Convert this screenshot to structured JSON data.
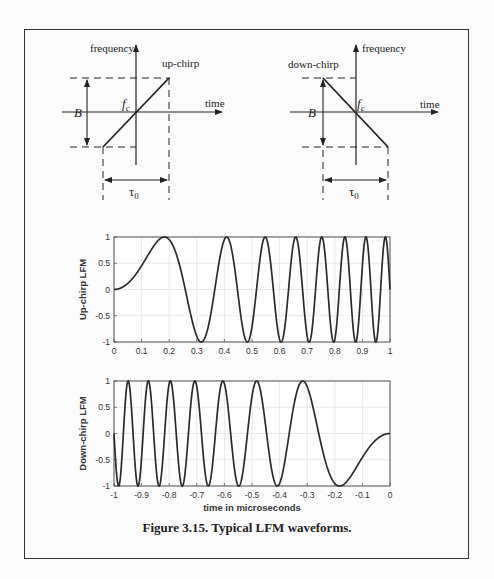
{
  "caption": "Figure 3.15. Typical LFM waveforms.",
  "diagrams": {
    "up": {
      "y_axis_label": "frequency",
      "x_axis_label": "time",
      "chirp_label": "up-chirp",
      "bandwidth_label": "B",
      "center_freq_label": "f",
      "center_freq_sub": "c",
      "duration_label": "τ",
      "duration_sub": "0"
    },
    "down": {
      "y_axis_label": "frequency",
      "x_axis_label": "time",
      "chirp_label": "down-chirp",
      "bandwidth_label": "B",
      "center_freq_label": "f",
      "center_freq_sub": "c",
      "duration_label": "τ",
      "duration_sub": "0"
    }
  },
  "chart_data": [
    {
      "type": "line",
      "title": "",
      "xlabel": "",
      "ylabel": "Up-chirp LFM",
      "xlim": [
        0,
        1
      ],
      "ylim": [
        -1,
        1
      ],
      "xticks": [
        "0",
        "0.1",
        "0.2",
        "0.3",
        "0.4",
        "0.5",
        "0.6",
        "0.7",
        "0.8",
        "0.9",
        "1"
      ],
      "yticks": [
        "-1",
        "-0.5",
        "0",
        "0.5",
        "1"
      ],
      "grid": true,
      "series": [
        {
          "name": "up-chirp",
          "function": "sin(pi*k*t^2)",
          "k": 15,
          "t_range": [
            0,
            1
          ]
        }
      ]
    },
    {
      "type": "line",
      "title": "",
      "xlabel": "time in microseconds",
      "ylabel": "Down-chirp LFM",
      "xlim": [
        -1,
        0
      ],
      "ylim": [
        -1,
        1
      ],
      "xticks": [
        "-1",
        "-0.9",
        "-0.8",
        "-0.7",
        "-0.6",
        "-0.5",
        "-0.4",
        "-0.3",
        "-0.2",
        "-0.1",
        "0"
      ],
      "yticks": [
        "-1",
        "-0.5",
        "0",
        "0.5",
        "1"
      ],
      "grid": true,
      "series": [
        {
          "name": "down-chirp",
          "function": "-sin(pi*k*t^2)",
          "k": 15,
          "t_range": [
            -1,
            0
          ]
        }
      ]
    }
  ]
}
